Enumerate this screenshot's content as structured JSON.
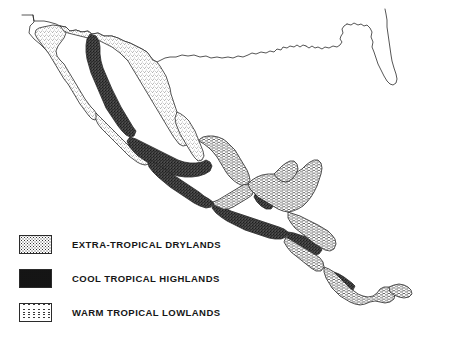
{
  "figure": {
    "kind": "thematic-map",
    "title_visible": false,
    "background_color": "#ffffff",
    "outline_color": "#2b2b2b",
    "width": 452,
    "height": 345
  },
  "legend": {
    "items": [
      {
        "key": "extra-tropical-drylands",
        "label": "EXTRA-TROPICAL DRYLANDS",
        "pattern": "light-stipple",
        "swatch_fill": "#ffffff",
        "swatch_ink": "#333333"
      },
      {
        "key": "cool-tropical-highlands",
        "label": "COOL TROPICAL HIGHLANDS",
        "pattern": "dense-dark",
        "swatch_fill": "#4a4a4a",
        "swatch_ink": "#111111"
      },
      {
        "key": "warm-tropical-lowlands",
        "label": "WARM TROPICAL LOWLANDS",
        "pattern": "horizontal-dashes",
        "swatch_fill": "#ffffff",
        "swatch_ink": "#3a3a3a"
      }
    ]
  },
  "map_regions": {
    "drylands": [
      "baja-california-peninsula",
      "northern-mexico-plateau",
      "sonora-chihuahua",
      "northeast-mexico-gulf-slope",
      "central-pacific-slope"
    ],
    "highlands": [
      "sierra-madre-occidental",
      "trans-mexican-volcanic-belt",
      "sierra-madre-del-sur",
      "chiapas-guatemala-highlands",
      "honduras-nicaragua-highlands",
      "costa-rica-cordillera"
    ],
    "lowlands": [
      "gulf-coastal-plain",
      "yucatan-peninsula",
      "peten-belize",
      "caribbean-coast-honduras-nicaragua",
      "pacific-coastal-strip-central-america",
      "panama-isthmus"
    ],
    "unshaded": [
      "united-states",
      "florida-peninsula",
      "southern-california"
    ]
  }
}
